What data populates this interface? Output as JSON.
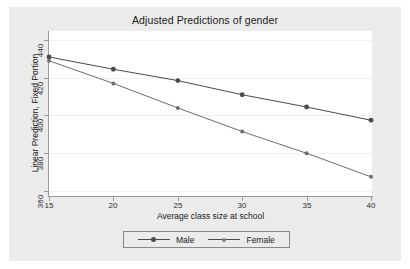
{
  "chart_data": {
    "type": "line",
    "title": "Adjusted Predictions of gender",
    "xlabel": "Average class size at school",
    "ylabel": "Linear Prediction, Fixed Portion",
    "x": [
      15,
      20,
      25,
      30,
      35,
      40
    ],
    "xticks": [
      "15",
      "20",
      "25",
      "30",
      "35",
      "40"
    ],
    "yticks": [
      "360",
      "380",
      "400",
      "420",
      "440"
    ],
    "xlim": [
      15,
      40
    ],
    "ylim": [
      355,
      443
    ],
    "grid": "horizontal",
    "legend_position": "bottom",
    "series": [
      {
        "name": "Male",
        "values": [
          431,
          424.5,
          418.5,
          411,
          404.5,
          397.5
        ],
        "color": "#4a4a4a",
        "marker": "filled-circle"
      },
      {
        "name": "Female",
        "values": [
          429,
          417,
          404,
          391.5,
          380,
          367.5
        ],
        "color": "#6e6e6e",
        "marker": "small-circle"
      }
    ]
  },
  "legend": {
    "entries": [
      {
        "label": "Male"
      },
      {
        "label": "Female"
      }
    ]
  },
  "colors": {
    "graph_background": "#ebebeb",
    "plot_background": "#ffffff",
    "axis": "#9a9a9a",
    "gridline": "#f0f0f0",
    "series_male": "#4a4a4a",
    "series_female": "#6e6e6e"
  }
}
